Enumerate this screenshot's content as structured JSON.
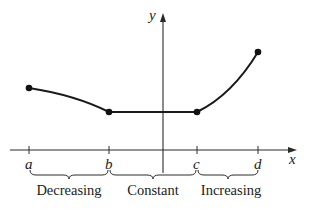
{
  "diagram": {
    "axes": {
      "x_label": "x",
      "y_label": "y"
    },
    "ticks": [
      {
        "id": "a",
        "label": "a"
      },
      {
        "id": "b",
        "label": "b"
      },
      {
        "id": "c",
        "label": "c"
      },
      {
        "id": "d",
        "label": "d"
      }
    ],
    "intervals": [
      {
        "from": "a",
        "to": "b",
        "label": "Decreasing"
      },
      {
        "from": "b",
        "to": "c",
        "label": "Constant"
      },
      {
        "from": "c",
        "to": "d",
        "label": "Increasing"
      }
    ],
    "points": [
      {
        "id": "a",
        "relative_height": "medium"
      },
      {
        "id": "b",
        "relative_height": "low"
      },
      {
        "id": "c",
        "relative_height": "low"
      },
      {
        "id": "d",
        "relative_height": "high"
      }
    ]
  }
}
